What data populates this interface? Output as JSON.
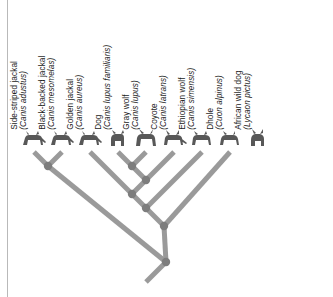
{
  "figure": {
    "type": "cladogram",
    "title": "",
    "branch_color": "#9a9a9a",
    "node_color": "#7d7d7d",
    "background": "#ffffff",
    "rule_color": "#b9b9b9"
  },
  "taxa": [
    {
      "id": "side-striped-jackal",
      "common": "Side-striped jackal",
      "species": "(Canis adustus)",
      "tip_x": 34,
      "silhouette": "jackal-standing"
    },
    {
      "id": "black-backed-jackal",
      "common": "Black-backed jackal",
      "species": "(Canis mesomelas)",
      "tip_x": 62,
      "silhouette": "jackal-standing"
    },
    {
      "id": "golden-jackal",
      "common": "Golden jackal",
      "species": "(Canis aureus)",
      "tip_x": 90,
      "silhouette": "jackal-standing"
    },
    {
      "id": "dog",
      "common": "Dog",
      "species": "(Canis lupus familiaris)",
      "tip_x": 118,
      "silhouette": "dog-sitting"
    },
    {
      "id": "gray-wolf",
      "common": "Gray wolf",
      "species": "(Canis lupus)",
      "tip_x": 146,
      "silhouette": "wolf-howling"
    },
    {
      "id": "coyote",
      "common": "Coyote",
      "species": "(Canis latrans)",
      "tip_x": 174,
      "silhouette": "coyote-standing"
    },
    {
      "id": "ethiopian-wolf",
      "common": "Ethiopian wolf",
      "species": "(Canis simensis)",
      "tip_x": 202,
      "silhouette": "wolf-standing"
    },
    {
      "id": "dhole",
      "common": "Dhole",
      "species": "(Cuon alpinus)",
      "tip_x": 230,
      "silhouette": "dhole-standing"
    },
    {
      "id": "african-wild-dog",
      "common": "African wild dog",
      "species": "(Lycaon pictus)",
      "tip_x": 258,
      "silhouette": "wilddog-sitting"
    }
  ],
  "nodes": [
    {
      "id": "n-jackal-pair",
      "x": 48,
      "y": 166,
      "children": [
        "side-striped-jackal",
        "black-backed-jackal"
      ]
    },
    {
      "id": "n-dog-wolf",
      "x": 132,
      "y": 166,
      "children": [
        "dog",
        "gray-wolf"
      ]
    },
    {
      "id": "n-coyote",
      "x": 146,
      "y": 180,
      "children": [
        "n-dog-wolf",
        "coyote"
      ]
    },
    {
      "id": "n-golden",
      "x": 132,
      "y": 194,
      "children": [
        "golden-jackal",
        "n-coyote"
      ]
    },
    {
      "id": "n-ethiopian",
      "x": 146,
      "y": 208,
      "children": [
        "n-golden",
        "ethiopian-wolf"
      ]
    },
    {
      "id": "n-dhole",
      "x": 164,
      "y": 226,
      "children": [
        "n-ethiopian",
        "dhole"
      ]
    },
    {
      "id": "n-root",
      "x": 166,
      "y": 262,
      "children": [
        "n-jackal-pair",
        "n-dhole"
      ],
      "note": "root node; stem extends down-left"
    }
  ],
  "root_stem": {
    "from_x": 166,
    "from_y": 262,
    "to_x": 146,
    "to_y": 282
  }
}
